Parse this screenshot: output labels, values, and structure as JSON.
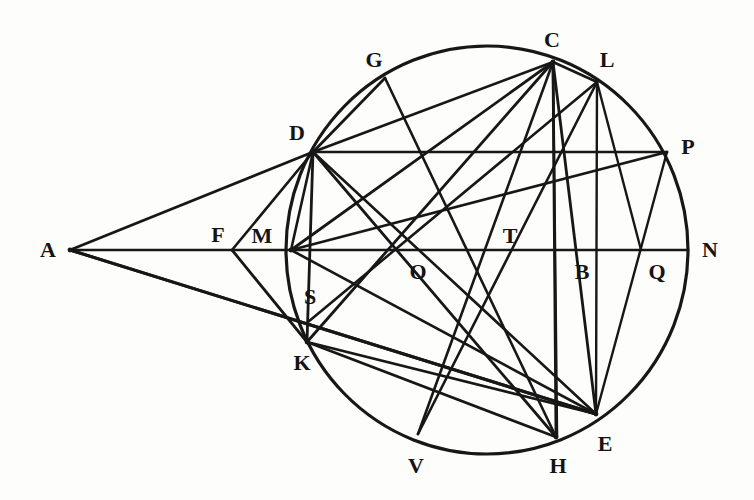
{
  "figure": {
    "background_color": "#fdfdfb",
    "ink_color": "#171717",
    "label_color": "#141414"
  },
  "chart_data": {
    "type": "diagram",
    "xlabel": "",
    "ylabel": "",
    "xlim": [
      0,
      754
    ],
    "ylim": [
      0,
      500
    ],
    "grid": false,
    "legend": "none",
    "circle": {
      "center_x": 487,
      "center_y": 250,
      "radius_x": 201,
      "radius_y": 204,
      "stroke_width": 3.2
    },
    "points": [
      {
        "id": "A",
        "label": "A",
        "x": 70,
        "y": 250,
        "label_x": 48,
        "label_y": 250
      },
      {
        "id": "B",
        "label": "B",
        "x": 578,
        "y": 250,
        "label_x": 582,
        "label_y": 272
      },
      {
        "id": "C",
        "label": "C",
        "x": 553,
        "y": 62,
        "label_x": 552,
        "label_y": 40
      },
      {
        "id": "D",
        "label": "D",
        "x": 313,
        "y": 152,
        "label_x": 297,
        "label_y": 133
      },
      {
        "id": "E",
        "label": "E",
        "x": 596,
        "y": 414,
        "label_x": 605,
        "label_y": 444
      },
      {
        "id": "F",
        "label": "F",
        "x": 232,
        "y": 250,
        "label_x": 218,
        "label_y": 235
      },
      {
        "id": "G",
        "label": "G",
        "x": 385,
        "y": 78,
        "label_x": 374,
        "label_y": 60
      },
      {
        "id": "H",
        "label": "H",
        "x": 556,
        "y": 437,
        "label_x": 558,
        "label_y": 466
      },
      {
        "id": "K",
        "label": "K",
        "x": 307,
        "y": 342,
        "label_x": 302,
        "label_y": 363
      },
      {
        "id": "L",
        "label": "L",
        "x": 597,
        "y": 82,
        "label_x": 607,
        "label_y": 60
      },
      {
        "id": "M",
        "label": "M",
        "x": 291,
        "y": 250,
        "label_x": 262,
        "label_y": 236
      },
      {
        "id": "N",
        "label": "N",
        "x": 688,
        "y": 250,
        "label_x": 710,
        "label_y": 250
      },
      {
        "id": "O",
        "label": "O",
        "x": 416,
        "y": 250,
        "label_x": 418,
        "label_y": 272
      },
      {
        "id": "P",
        "label": "P",
        "x": 667,
        "y": 152,
        "label_x": 688,
        "label_y": 147
      },
      {
        "id": "Q",
        "label": "Q",
        "x": 641,
        "y": 250,
        "label_x": 657,
        "label_y": 272
      },
      {
        "id": "S",
        "label": "S",
        "x": 308,
        "y": 322,
        "label_x": 310,
        "label_y": 297
      },
      {
        "id": "T",
        "label": "T",
        "x": 489,
        "y": 250,
        "label_x": 510,
        "label_y": 236
      },
      {
        "id": "V",
        "label": "V",
        "x": 418,
        "y": 434,
        "label_x": 416,
        "label_y": 466
      }
    ],
    "segments": [
      {
        "name": "A-N-axis",
        "from": "A",
        "to": "N",
        "width": 2.6
      },
      {
        "name": "A-D",
        "from": "A",
        "to": "D",
        "width": 2.8
      },
      {
        "name": "A-S-ext",
        "from": "A",
        "to": "S",
        "width": 3.0,
        "extend_to_x": 596,
        "extend_to_y": 414
      },
      {
        "name": "A-K-ext",
        "from": "A",
        "to": "K",
        "width": 3.0,
        "extend_to_x": 596,
        "extend_to_y": 414
      },
      {
        "name": "D-G",
        "from": "D",
        "to": "G",
        "width": 2.8
      },
      {
        "name": "D-C",
        "from": "D",
        "to": "C",
        "width": 2.8
      },
      {
        "name": "D-P",
        "from": "D",
        "to": "P",
        "width": 2.6
      },
      {
        "name": "D-K",
        "from": "D",
        "to": "K",
        "width": 2.8
      },
      {
        "name": "D-H",
        "from": "D",
        "to": "H",
        "width": 2.8
      },
      {
        "name": "D-E",
        "from": "D",
        "to": "E",
        "width": 2.6
      },
      {
        "name": "G-H",
        "from": "G",
        "to": "H",
        "width": 2.6
      },
      {
        "name": "C-M",
        "from": "C",
        "to": "M",
        "width": 2.8
      },
      {
        "name": "C-K",
        "from": "C",
        "to": "K",
        "width": 2.8
      },
      {
        "name": "C-V",
        "from": "C",
        "to": "V",
        "width": 2.6
      },
      {
        "name": "C-H",
        "from": "C",
        "to": "H",
        "width": 2.8
      },
      {
        "name": "C-B-E",
        "from": "C",
        "to": "E",
        "width": 2.8
      },
      {
        "name": "C-B-vert",
        "from": "C",
        "to": "Hv",
        "width": 2.6,
        "to_x": 557,
        "to_y": 437
      },
      {
        "name": "C-L",
        "from": "C",
        "to": "L",
        "width": 2.6
      },
      {
        "name": "L-Q",
        "from": "L",
        "to": "Q",
        "width": 2.4
      },
      {
        "name": "L-E",
        "from": "L",
        "to": "E",
        "width": 2.4
      },
      {
        "name": "P-Q-E",
        "from": "P",
        "to": "E",
        "width": 2.4
      },
      {
        "name": "M-P-diag",
        "from": "M",
        "to": "P",
        "width": 2.6
      },
      {
        "name": "M-E",
        "from": "M",
        "to": "E",
        "width": 2.6
      },
      {
        "name": "M-D-left",
        "from": "M",
        "to": "D",
        "width": 2.6
      },
      {
        "name": "F-D",
        "from": "F",
        "to": "D",
        "width": 2.6
      },
      {
        "name": "F-K",
        "from": "F",
        "to": "K",
        "width": 2.8
      },
      {
        "name": "K-E-chord",
        "from": "K",
        "to": "E",
        "width": 2.8
      },
      {
        "name": "K-H-chord",
        "from": "K",
        "to": "H",
        "width": 2.8
      },
      {
        "name": "S-T-ext",
        "from": "S",
        "to": "L",
        "width": 2.6
      },
      {
        "name": "V-L-chord",
        "from": "V",
        "to": "L",
        "width": 2.6
      }
    ],
    "annotations": []
  }
}
